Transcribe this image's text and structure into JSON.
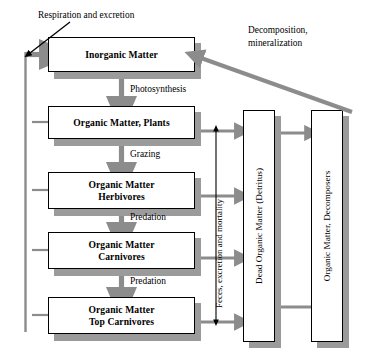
{
  "diagram": {
    "title_annotation": "Respiration and excretion",
    "colors": {
      "box_border": "#000000",
      "box_fill": "#ffffff",
      "shadow": "#9b9b9b",
      "flow_arrow": "#8c8c8c",
      "thin_arrow": "#000000",
      "background": "#ffffff"
    },
    "boxes": [
      {
        "id": "inorganic",
        "label": "Inorganic Matter",
        "x": 48,
        "y": 37,
        "w": 147,
        "h": 35
      },
      {
        "id": "plants",
        "label": "Organic Matter, Plants",
        "x": 48,
        "y": 106,
        "w": 147,
        "h": 33
      },
      {
        "id": "herbivores",
        "label": "Organic Matter\nHerbivores",
        "x": 48,
        "y": 172,
        "w": 147,
        "h": 37
      },
      {
        "id": "carnivores",
        "label": "Organic Matter\nCarnivores",
        "x": 48,
        "y": 232,
        "w": 147,
        "h": 37
      },
      {
        "id": "topcarnivores",
        "label": "Organic Matter\nTop Carnivores",
        "x": 48,
        "y": 297,
        "w": 147,
        "h": 37
      }
    ],
    "vertical_boxes": [
      {
        "id": "detritus",
        "label": "Dead Organic Matter (Detritus)",
        "x": 243,
        "y": 110,
        "w": 32,
        "h": 232
      },
      {
        "id": "decomposers",
        "label": "Organic Matter, Decomposers",
        "x": 311,
        "y": 110,
        "w": 32,
        "h": 232
      }
    ],
    "flow_labels": [
      {
        "id": "photosynthesis",
        "text": "Photosynthesis",
        "x": 128,
        "y": 83
      },
      {
        "id": "grazing",
        "text": "Grazing",
        "x": 128,
        "y": 150
      },
      {
        "id": "predation-1",
        "text": "Predation",
        "x": 128,
        "y": 213
      },
      {
        "id": "predation-2",
        "text": "Predation",
        "x": 128,
        "y": 277
      }
    ],
    "decomposition_label": {
      "line1": "Decomposition,",
      "line2": "mineralization",
      "x": 250,
      "y": 27
    },
    "feces_label": {
      "text": "Feces, excretion and mortality",
      "x": 219,
      "y": 308
    }
  }
}
